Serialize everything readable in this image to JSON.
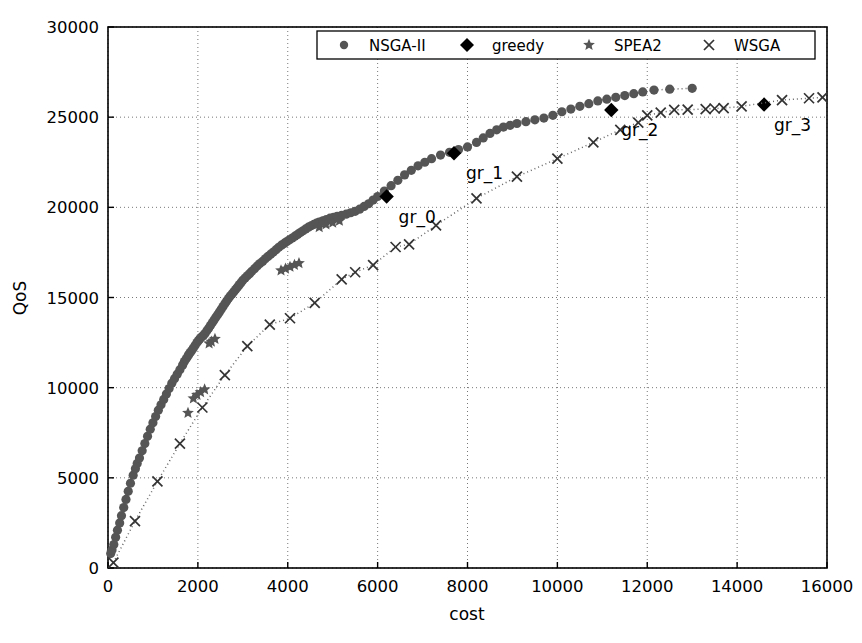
{
  "chart_data": {
    "type": "scatter",
    "title": "",
    "xlabel": "cost",
    "ylabel": "QoS",
    "xlim": [
      0,
      16000
    ],
    "ylim": [
      0,
      30000
    ],
    "xticks": [
      0,
      2000,
      4000,
      6000,
      8000,
      10000,
      12000,
      14000,
      16000
    ],
    "yticks": [
      0,
      5000,
      10000,
      15000,
      20000,
      25000,
      30000
    ],
    "grid": true,
    "legend_position": "upper center",
    "legend": [
      {
        "name": "NSGA-II",
        "marker": "circle",
        "color": "#555555"
      },
      {
        "name": "greedy",
        "marker": "diamond",
        "color": "#000000"
      },
      {
        "name": "SPEA2",
        "marker": "star",
        "color": "#555555"
      },
      {
        "name": "WSGA",
        "marker": "x",
        "color": "#333333"
      }
    ],
    "annotations": [
      {
        "text": "gr_0",
        "x": 6200,
        "y": 20600,
        "dx": 12,
        "dy": 26
      },
      {
        "text": "gr_1",
        "x": 7700,
        "y": 23000,
        "dx": 12,
        "dy": 26
      },
      {
        "text": "gr_2",
        "x": 11200,
        "y": 25400,
        "dx": 10,
        "dy": 26
      },
      {
        "text": "gr_3",
        "x": 14600,
        "y": 25700,
        "dx": 10,
        "dy": 26
      }
    ],
    "series": [
      {
        "name": "NSGA-II",
        "marker": "circle",
        "color": "#555555",
        "connect": true,
        "points": [
          [
            60,
            800
          ],
          [
            90,
            1000
          ],
          [
            130,
            1300
          ],
          [
            170,
            1700
          ],
          [
            210,
            2100
          ],
          [
            260,
            2500
          ],
          [
            300,
            2900
          ],
          [
            350,
            3350
          ],
          [
            400,
            3800
          ],
          [
            450,
            4250
          ],
          [
            500,
            4700
          ],
          [
            560,
            5150
          ],
          [
            610,
            5500
          ],
          [
            650,
            5800
          ],
          [
            700,
            6100
          ],
          [
            760,
            6500
          ],
          [
            820,
            6900
          ],
          [
            880,
            7300
          ],
          [
            940,
            7700
          ],
          [
            1000,
            8050
          ],
          [
            1060,
            8400
          ],
          [
            1120,
            8750
          ],
          [
            1180,
            9050
          ],
          [
            1240,
            9350
          ],
          [
            1300,
            9650
          ],
          [
            1360,
            9950
          ],
          [
            1420,
            10250
          ],
          [
            1480,
            10500
          ],
          [
            1540,
            10750
          ],
          [
            1600,
            11000
          ],
          [
            1660,
            11250
          ],
          [
            1700,
            11450
          ],
          [
            1740,
            11600
          ],
          [
            1780,
            11750
          ],
          [
            1800,
            11850
          ],
          [
            1830,
            11950
          ],
          [
            1860,
            12050
          ],
          [
            1900,
            12200
          ],
          [
            1940,
            12350
          ],
          [
            1980,
            12500
          ],
          [
            2010,
            12600
          ],
          [
            2040,
            12700
          ],
          [
            2070,
            12780
          ],
          [
            2100,
            12850
          ],
          [
            2130,
            12920
          ],
          [
            2160,
            13000
          ],
          [
            2200,
            13150
          ],
          [
            2240,
            13300
          ],
          [
            2280,
            13450
          ],
          [
            2320,
            13600
          ],
          [
            2360,
            13750
          ],
          [
            2400,
            13900
          ],
          [
            2440,
            14050
          ],
          [
            2480,
            14200
          ],
          [
            2520,
            14350
          ],
          [
            2560,
            14500
          ],
          [
            2600,
            14650
          ],
          [
            2640,
            14800
          ],
          [
            2680,
            14950
          ],
          [
            2720,
            15080
          ],
          [
            2760,
            15200
          ],
          [
            2800,
            15320
          ],
          [
            2840,
            15450
          ],
          [
            2880,
            15570
          ],
          [
            2920,
            15700
          ],
          [
            2960,
            15820
          ],
          [
            3000,
            15950
          ],
          [
            3050,
            16080
          ],
          [
            3100,
            16200
          ],
          [
            3150,
            16320
          ],
          [
            3200,
            16450
          ],
          [
            3260,
            16600
          ],
          [
            3320,
            16750
          ],
          [
            3380,
            16880
          ],
          [
            3440,
            17000
          ],
          [
            3500,
            17150
          ],
          [
            3560,
            17280
          ],
          [
            3620,
            17400
          ],
          [
            3680,
            17520
          ],
          [
            3740,
            17650
          ],
          [
            3800,
            17780
          ],
          [
            3860,
            17900
          ],
          [
            3920,
            18000
          ],
          [
            3980,
            18100
          ],
          [
            4040,
            18200
          ],
          [
            4100,
            18300
          ],
          [
            4160,
            18400
          ],
          [
            4220,
            18500
          ],
          [
            4280,
            18600
          ],
          [
            4340,
            18700
          ],
          [
            4400,
            18800
          ],
          [
            4460,
            18900
          ],
          [
            4520,
            18980
          ],
          [
            4580,
            19050
          ],
          [
            4640,
            19120
          ],
          [
            4700,
            19180
          ],
          [
            4780,
            19250
          ],
          [
            4860,
            19320
          ],
          [
            4940,
            19400
          ],
          [
            5020,
            19450
          ],
          [
            5100,
            19500
          ],
          [
            5200,
            19560
          ],
          [
            5300,
            19620
          ],
          [
            5400,
            19700
          ],
          [
            5500,
            19780
          ],
          [
            5600,
            19900
          ],
          [
            5700,
            20050
          ],
          [
            5800,
            20200
          ],
          [
            5900,
            20400
          ],
          [
            6000,
            20600
          ],
          [
            6150,
            20900
          ],
          [
            6300,
            21200
          ],
          [
            6450,
            21500
          ],
          [
            6600,
            21800
          ],
          [
            6750,
            22050
          ],
          [
            6900,
            22300
          ],
          [
            7050,
            22500
          ],
          [
            7200,
            22700
          ],
          [
            7400,
            22900
          ],
          [
            7600,
            23050
          ],
          [
            7800,
            23200
          ],
          [
            8000,
            23350
          ],
          [
            8200,
            23600
          ],
          [
            8350,
            23850
          ],
          [
            8500,
            24100
          ],
          [
            8650,
            24300
          ],
          [
            8800,
            24450
          ],
          [
            8950,
            24550
          ],
          [
            9100,
            24650
          ],
          [
            9300,
            24750
          ],
          [
            9500,
            24850
          ],
          [
            9700,
            24950
          ],
          [
            9900,
            25100
          ],
          [
            10100,
            25300
          ],
          [
            10300,
            25450
          ],
          [
            10500,
            25600
          ],
          [
            10700,
            25750
          ],
          [
            10900,
            25900
          ],
          [
            11100,
            26000
          ],
          [
            11300,
            26100
          ],
          [
            11500,
            26200
          ],
          [
            11700,
            26300
          ],
          [
            11900,
            26400
          ],
          [
            12150,
            26500
          ],
          [
            12500,
            26550
          ],
          [
            13000,
            26600
          ]
        ]
      },
      {
        "name": "greedy",
        "marker": "diamond",
        "color": "#000000",
        "connect": false,
        "points": [
          [
            6200,
            20600
          ],
          [
            7700,
            23000
          ],
          [
            11200,
            25400
          ],
          [
            14600,
            25700
          ]
        ]
      },
      {
        "name": "SPEA2",
        "marker": "star",
        "color": "#555555",
        "connect": false,
        "points": [
          [
            1780,
            8600
          ],
          [
            1900,
            9400
          ],
          [
            1980,
            9600
          ],
          [
            2060,
            9750
          ],
          [
            2150,
            9900
          ],
          [
            2250,
            12450
          ],
          [
            2300,
            12550
          ],
          [
            2380,
            12700
          ],
          [
            3850,
            16500
          ],
          [
            3950,
            16600
          ],
          [
            4050,
            16700
          ],
          [
            4150,
            16800
          ],
          [
            4250,
            16900
          ],
          [
            4700,
            18900
          ],
          [
            4850,
            19050
          ],
          [
            5000,
            19150
          ],
          [
            5150,
            19250
          ]
        ]
      },
      {
        "name": "WSGA",
        "marker": "x",
        "color": "#333333",
        "connect": true,
        "points": [
          [
            120,
            300
          ],
          [
            600,
            2600
          ],
          [
            1100,
            4800
          ],
          [
            1600,
            6900
          ],
          [
            2100,
            8900
          ],
          [
            2600,
            10700
          ],
          [
            3100,
            12300
          ],
          [
            3600,
            13500
          ],
          [
            4050,
            13850
          ],
          [
            4600,
            14700
          ],
          [
            5200,
            16000
          ],
          [
            5500,
            16400
          ],
          [
            5900,
            16800
          ],
          [
            6400,
            17800
          ],
          [
            6700,
            17950
          ],
          [
            7300,
            19000
          ],
          [
            8200,
            20500
          ],
          [
            9100,
            21700
          ],
          [
            10000,
            22700
          ],
          [
            10800,
            23600
          ],
          [
            11400,
            24300
          ],
          [
            11800,
            24700
          ],
          [
            12000,
            25100
          ],
          [
            12300,
            25250
          ],
          [
            12600,
            25400
          ],
          [
            12900,
            25420
          ],
          [
            13300,
            25450
          ],
          [
            13500,
            25480
          ],
          [
            13700,
            25500
          ],
          [
            14100,
            25600
          ],
          [
            15000,
            25950
          ],
          [
            15600,
            26050
          ],
          [
            15900,
            26100
          ]
        ]
      }
    ]
  },
  "axis": {
    "xlabel": "cost",
    "ylabel": "QoS",
    "xtick_labels": [
      "0",
      "2000",
      "4000",
      "6000",
      "8000",
      "10000",
      "12000",
      "14000",
      "16000"
    ],
    "ytick_labels": [
      "0",
      "5000",
      "10000",
      "15000",
      "20000",
      "25000",
      "30000"
    ]
  },
  "legend_items": [
    {
      "label": "NSGA-II",
      "icon": "circle-marker-icon"
    },
    {
      "label": "greedy",
      "icon": "diamond-marker-icon"
    },
    {
      "label": "SPEA2",
      "icon": "star-marker-icon"
    },
    {
      "label": "WSGA",
      "icon": "x-marker-icon"
    }
  ]
}
